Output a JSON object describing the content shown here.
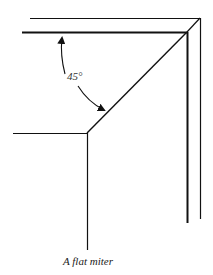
{
  "figure": {
    "caption": "A flat miter",
    "angle_label": "45°",
    "colors": {
      "line": "#111111",
      "background": "#ffffff"
    }
  }
}
